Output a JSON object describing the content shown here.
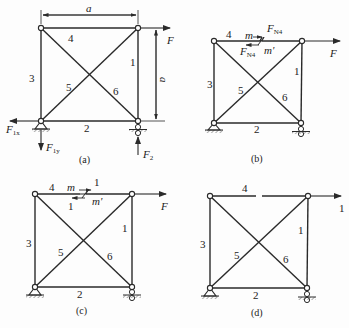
{
  "figure": {
    "panels": [
      {
        "id": "a",
        "caption": "(a)",
        "members": {
          "m1": "1",
          "m2": "2",
          "m3": "3",
          "m4": "4",
          "m5": "5",
          "m6": "6"
        },
        "dimension_top": "a",
        "dimension_right": "a",
        "loads": {
          "F": "F",
          "F1x_main": "F",
          "F1x_sub": "1x",
          "F1y_main": "F",
          "F1y_sub": "1y",
          "F2_main": "F",
          "F2_sub": "2"
        }
      },
      {
        "id": "b",
        "caption": "(b)",
        "members": {
          "m1": "1",
          "m2": "2",
          "m3": "3",
          "m4": "4",
          "m5": "5",
          "m6": "6"
        },
        "section": {
          "m": "m",
          "m_prime": "m'",
          "force_main": "F",
          "force_sub": "N4"
        },
        "loads": {
          "F": "F"
        }
      },
      {
        "id": "c",
        "caption": "(c)",
        "members": {
          "m1": "1",
          "m2": "2",
          "m3": "3",
          "m4": "4",
          "m5": "5",
          "m6": "6"
        },
        "section": {
          "m": "m",
          "m_prime": "m'",
          "unit_top": "1",
          "unit_bottom": "1"
        },
        "loads": {
          "F": "F"
        }
      },
      {
        "id": "d",
        "caption": "(d)",
        "members": {
          "m1": "1",
          "m2": "2",
          "m3": "3",
          "m4": "4",
          "m5": "5",
          "m6": "6"
        },
        "loads": {
          "unit": "1"
        }
      }
    ],
    "colors": {
      "line": "#2a2a2a",
      "background": "#fdfdfd"
    }
  }
}
